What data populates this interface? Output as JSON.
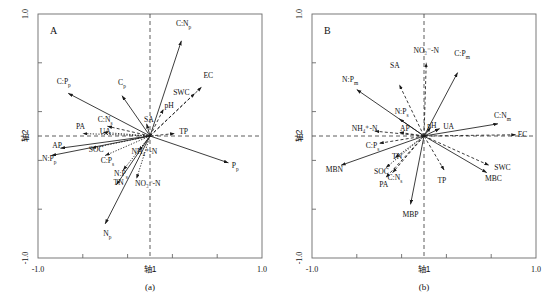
{
  "figure": {
    "width": 548,
    "height": 298,
    "background": "#ffffff",
    "ink_color": "#111111",
    "axis_color": "#6a6a6a"
  },
  "panels": [
    {
      "id": "a",
      "letter": "A",
      "caption": "(a)",
      "chart_data": {
        "type": "scatter",
        "subtype": "ordination-biplot",
        "title": "",
        "xlabel": "轴1",
        "ylabel": "轴2",
        "xlim": [
          -1.0,
          1.0
        ],
        "ylim": [
          -1.0,
          1.0
        ],
        "xticklabels": [
          "-1.0",
          "轴1",
          "1.0"
        ],
        "yticklabels": [
          "1.0",
          "轴2",
          "-1.0"
        ],
        "grid": false,
        "zero_lines": true,
        "legend": "none",
        "n_minor_ticks_per_axis": 4,
        "vectors": [
          {
            "label": "C:N",
            "sub": "p",
            "x": 0.28,
            "y": 0.78,
            "style": "solid",
            "lx": 0.3,
            "ly": 0.92,
            "anchor": "middle"
          },
          {
            "label": "EC",
            "sub": "",
            "x": 0.46,
            "y": 0.4,
            "style": "dashed",
            "lx": 0.52,
            "ly": 0.5,
            "anchor": "middle"
          },
          {
            "label": "SWC",
            "sub": "",
            "x": 0.4,
            "y": 0.35,
            "style": "dashed",
            "lx": 0.28,
            "ly": 0.36,
            "anchor": "middle"
          },
          {
            "label": "C:P",
            "sub": "p",
            "x": -0.73,
            "y": 0.35,
            "style": "solid",
            "lx": -0.77,
            "ly": 0.45,
            "anchor": "middle"
          },
          {
            "label": "C",
            "sub": "p",
            "x": -0.25,
            "y": 0.33,
            "style": "solid",
            "lx": -0.25,
            "ly": 0.44,
            "anchor": "middle"
          },
          {
            "label": "pH",
            "sub": "",
            "x": 0.12,
            "y": 0.22,
            "style": "dashed",
            "lx": 0.17,
            "ly": 0.25,
            "anchor": "middle"
          },
          {
            "label": "SA",
            "sub": "",
            "x": -0.03,
            "y": 0.1,
            "style": "solid",
            "lx": -0.01,
            "ly": 0.14,
            "anchor": "middle"
          },
          {
            "label": "C:N",
            "sub": "s",
            "x": -0.38,
            "y": 0.08,
            "style": "dashed",
            "lx": -0.4,
            "ly": 0.14,
            "anchor": "middle"
          },
          {
            "label": "UA",
            "sub": "",
            "x": -0.42,
            "y": 0.03,
            "style": "dotted",
            "lx": -0.4,
            "ly": 0.04,
            "anchor": "middle"
          },
          {
            "label": "PA",
            "sub": "",
            "x": -0.6,
            "y": 0.02,
            "style": "dotted",
            "lx": -0.62,
            "ly": 0.08,
            "anchor": "middle"
          },
          {
            "label": "TP",
            "sub": "",
            "x": 0.22,
            "y": 0.02,
            "style": "dashed",
            "lx": 0.3,
            "ly": 0.04,
            "anchor": "middle"
          },
          {
            "label": "AP",
            "sub": "",
            "x": -0.8,
            "y": -0.1,
            "style": "solid",
            "lx": -0.83,
            "ly": -0.08,
            "anchor": "middle"
          },
          {
            "label": "SOC",
            "sub": "",
            "x": -0.52,
            "y": -0.1,
            "style": "dotted",
            "lx": -0.48,
            "ly": -0.11,
            "anchor": "middle"
          },
          {
            "label": "N:P",
            "sub": "p",
            "x": -0.88,
            "y": -0.16,
            "style": "solid",
            "lx": -0.9,
            "ly": -0.18,
            "anchor": "middle"
          },
          {
            "label": "C:P",
            "sub": "s",
            "x": -0.4,
            "y": -0.16,
            "style": "dotted",
            "lx": -0.38,
            "ly": -0.2,
            "anchor": "middle"
          },
          {
            "label": "NH₄⁺-N",
            "sub": "",
            "x": -0.1,
            "y": -0.12,
            "style": "dotted",
            "lx": -0.05,
            "ly": -0.13,
            "anchor": "middle"
          },
          {
            "label": "P",
            "sub": "p",
            "x": 0.7,
            "y": -0.22,
            "style": "solid",
            "lx": 0.76,
            "ly": -0.24,
            "anchor": "middle"
          },
          {
            "label": "N:P",
            "sub": "s",
            "x": -0.24,
            "y": -0.28,
            "style": "dotted",
            "lx": -0.26,
            "ly": -0.31,
            "anchor": "middle"
          },
          {
            "label": "NO₃⁻-N",
            "sub": "",
            "x": -0.12,
            "y": -0.35,
            "style": "dotted",
            "lx": -0.02,
            "ly": -0.39,
            "anchor": "middle"
          },
          {
            "label": "TN",
            "sub": "",
            "x": -0.3,
            "y": -0.4,
            "style": "solid",
            "lx": -0.28,
            "ly": -0.38,
            "anchor": "middle"
          },
          {
            "label": "N",
            "sub": "p",
            "x": -0.4,
            "y": -0.72,
            "style": "solid",
            "lx": -0.38,
            "ly": -0.8,
            "anchor": "middle"
          }
        ]
      }
    },
    {
      "id": "b",
      "letter": "B",
      "caption": "(b)",
      "chart_data": {
        "type": "scatter",
        "subtype": "ordination-biplot",
        "title": "",
        "xlabel": "轴1",
        "ylabel": "轴2",
        "xlim": [
          -1.0,
          1.0
        ],
        "ylim": [
          -1.0,
          1.0
        ],
        "xticklabels": [
          "-1.0",
          "轴1",
          "1.0"
        ],
        "yticklabels": [
          "1.0",
          "轴2",
          "-1.0"
        ],
        "grid": false,
        "zero_lines": true,
        "legend": "none",
        "n_minor_ticks_per_axis": 4,
        "vectors": [
          {
            "label": "NO₃⁻-N",
            "sub": "",
            "x": 0.02,
            "y": 0.6,
            "style": "dashed",
            "lx": 0.02,
            "ly": 0.7,
            "anchor": "middle"
          },
          {
            "label": "C:P",
            "sub": "m",
            "x": 0.3,
            "y": 0.52,
            "style": "solid",
            "lx": 0.34,
            "ly": 0.68,
            "anchor": "middle"
          },
          {
            "label": "SA",
            "sub": "",
            "x": -0.22,
            "y": 0.42,
            "style": "dashed",
            "lx": -0.26,
            "ly": 0.58,
            "anchor": "middle"
          },
          {
            "label": "N:P",
            "sub": "m",
            "x": -0.6,
            "y": 0.38,
            "style": "solid",
            "lx": -0.66,
            "ly": 0.46,
            "anchor": "middle"
          },
          {
            "label": "N:P",
            "sub": "s",
            "x": -0.22,
            "y": 0.14,
            "style": "solid",
            "lx": -0.2,
            "ly": 0.2,
            "anchor": "middle"
          },
          {
            "label": "C:N",
            "sub": "m",
            "x": 0.66,
            "y": 0.1,
            "style": "solid",
            "lx": 0.7,
            "ly": 0.17,
            "anchor": "middle"
          },
          {
            "label": "UA",
            "sub": "",
            "x": 0.14,
            "y": 0.06,
            "style": "solid",
            "lx": 0.22,
            "ly": 0.08,
            "anchor": "middle"
          },
          {
            "label": "pH",
            "sub": "",
            "x": 0.06,
            "y": 0.07,
            "style": "solid",
            "lx": 0.07,
            "ly": 0.09,
            "anchor": "middle"
          },
          {
            "label": "EC",
            "sub": "",
            "x": 0.82,
            "y": 0.01,
            "style": "dashed",
            "lx": 0.88,
            "ly": 0.01,
            "anchor": "middle"
          },
          {
            "label": "AP",
            "sub": "",
            "x": -0.22,
            "y": 0.03,
            "style": "dashed",
            "lx": -0.17,
            "ly": 0.06,
            "anchor": "middle"
          },
          {
            "label": "NH₄⁺-N",
            "sub": "",
            "x": -0.44,
            "y": 0.04,
            "style": "dashed",
            "lx": -0.53,
            "ly": 0.06,
            "anchor": "middle"
          },
          {
            "label": "C:P",
            "sub": "s",
            "x": -0.4,
            "y": -0.06,
            "style": "dashed",
            "lx": -0.46,
            "ly": -0.08,
            "anchor": "middle"
          },
          {
            "label": "TN",
            "sub": "",
            "x": -0.26,
            "y": -0.18,
            "style": "dotted",
            "lx": -0.24,
            "ly": -0.17,
            "anchor": "middle"
          },
          {
            "label": "MBN",
            "sub": "",
            "x": -0.74,
            "y": -0.24,
            "style": "solid",
            "lx": -0.8,
            "ly": -0.27,
            "anchor": "middle"
          },
          {
            "label": "SOC",
            "sub": "",
            "x": -0.34,
            "y": -0.26,
            "style": "dotted",
            "lx": -0.38,
            "ly": -0.29,
            "anchor": "middle"
          },
          {
            "label": "C:N",
            "sub": "s",
            "x": -0.28,
            "y": -0.3,
            "style": "dashed",
            "lx": -0.26,
            "ly": -0.34,
            "anchor": "middle"
          },
          {
            "label": "PA",
            "sub": "",
            "x": -0.34,
            "y": -0.34,
            "style": "dashed",
            "lx": -0.36,
            "ly": -0.4,
            "anchor": "middle"
          },
          {
            "label": "SWC",
            "sub": "",
            "x": 0.58,
            "y": -0.24,
            "style": "dashed",
            "lx": 0.7,
            "ly": -0.26,
            "anchor": "middle"
          },
          {
            "label": "MBC",
            "sub": "",
            "x": 0.56,
            "y": -0.3,
            "style": "solid",
            "lx": 0.62,
            "ly": -0.35,
            "anchor": "middle"
          },
          {
            "label": "TP",
            "sub": "",
            "x": 0.18,
            "y": -0.28,
            "style": "dashed",
            "lx": 0.16,
            "ly": -0.36,
            "anchor": "middle"
          },
          {
            "label": "MBP",
            "sub": "",
            "x": -0.12,
            "y": -0.56,
            "style": "solid",
            "lx": -0.12,
            "ly": -0.64,
            "anchor": "middle"
          }
        ]
      }
    }
  ]
}
